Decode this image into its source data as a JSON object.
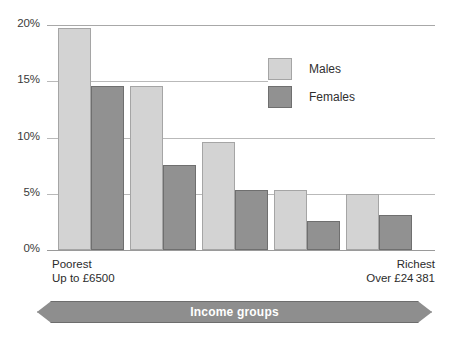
{
  "chart_data": {
    "type": "bar",
    "title": "",
    "xlabel": "Income groups",
    "ylabel": "",
    "ylim": [
      0,
      20
    ],
    "ytick_labels": [
      "20%",
      "15%",
      "10%",
      "5%",
      "0%"
    ],
    "ytick_values": [
      20,
      15,
      10,
      5,
      0
    ],
    "grid": true,
    "legend_position": "upper-right",
    "categories": [
      "Group 1",
      "Group 2",
      "Group 3",
      "Group 4",
      "Group 5"
    ],
    "category_captions": {
      "first_line1": "Poorest",
      "first_line2": "Up to £6500",
      "last_line1": "Richest",
      "last_line2": "Over £24 381"
    },
    "series": [
      {
        "name": "Males",
        "color": "#d3d3d3",
        "values": [
          19.7,
          14.6,
          9.6,
          5.3,
          5.0
        ]
      },
      {
        "name": "Females",
        "color": "#919191",
        "values": [
          14.6,
          7.6,
          5.3,
          2.6,
          3.1
        ]
      }
    ]
  },
  "axis": {
    "ticks": [
      {
        "label": "20%"
      },
      {
        "label": "15%"
      },
      {
        "label": "10%"
      },
      {
        "label": "5%"
      },
      {
        "label": "0%"
      }
    ]
  },
  "legend": {
    "items": [
      {
        "label": "Males",
        "swatch": "light-gray-swatch"
      },
      {
        "label": "Females",
        "swatch": "dark-gray-swatch"
      }
    ]
  },
  "captions": {
    "poorest_line1": "Poorest",
    "poorest_line2": "Up to £6500",
    "richest_line1": "Richest",
    "richest_line2": "Over £24 381"
  },
  "banner": {
    "label": "Income groups",
    "color": "#8e8e8e"
  },
  "colors": {
    "males": "#d3d3d3",
    "females": "#919191",
    "gridline": "#b9b9b9",
    "banner": "#8e8e8e",
    "text": "#2b2b2b"
  }
}
